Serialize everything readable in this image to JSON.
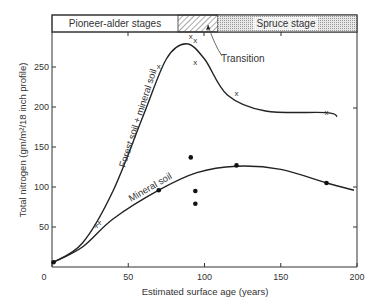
{
  "chart_data": {
    "type": "line",
    "title": "",
    "xlabel": "Estimated surface age (years)",
    "ylabel": "Total nitrogen (gm/m²/18 inch profile)",
    "xlim": [
      0,
      200
    ],
    "ylim": [
      0,
      290
    ],
    "x_ticks": [
      "0",
      "50",
      "100",
      "150",
      "200"
    ],
    "y_ticks": [
      "50",
      "100",
      "150",
      "200",
      "250"
    ],
    "grid": false,
    "stages": [
      {
        "label": "Pioneer-alder stages",
        "x_start": 0,
        "x_end": 84,
        "pattern": "none"
      },
      {
        "label": "",
        "x_start": 84,
        "x_end": 108,
        "pattern": "hatched"
      },
      {
        "label": "Spruce stage",
        "x_start": 108,
        "x_end": 200,
        "pattern": "stippled"
      }
    ],
    "annotations": [
      {
        "text": "Transition",
        "x": 106,
        "y": 228
      }
    ],
    "series": [
      {
        "name": "Forest soil + mineral soil",
        "marker": "x",
        "curve": [
          [
            1,
            6
          ],
          [
            20,
            30
          ],
          [
            40,
            95
          ],
          [
            60,
            190
          ],
          [
            75,
            260
          ],
          [
            88,
            279
          ],
          [
            100,
            260
          ],
          [
            115,
            215
          ],
          [
            140,
            195
          ],
          [
            180,
            193
          ],
          [
            187,
            188
          ]
        ],
        "points": [
          [
            29,
            52
          ],
          [
            31,
            56
          ],
          [
            70,
            251
          ],
          [
            91,
            289
          ],
          [
            94,
            284
          ],
          [
            94,
            256
          ],
          [
            121,
            218
          ],
          [
            180,
            194
          ]
        ]
      },
      {
        "name": "Mineral soil",
        "marker": "dot",
        "curve": [
          [
            1,
            6
          ],
          [
            20,
            25
          ],
          [
            40,
            60
          ],
          [
            70,
            96
          ],
          [
            95,
            118
          ],
          [
            121,
            126
          ],
          [
            150,
            122
          ],
          [
            180,
            105
          ],
          [
            198,
            96
          ]
        ],
        "points": [
          [
            1,
            6
          ],
          [
            70,
            96
          ],
          [
            91,
            137
          ],
          [
            94,
            95
          ],
          [
            94,
            79
          ],
          [
            121,
            127
          ],
          [
            180,
            105
          ]
        ]
      }
    ]
  },
  "labels": {
    "x_axis": "Estimated surface age (years)",
    "y_axis": "Total nitrogen (gm/m²/18 inch profile)",
    "stage_pioneer": "Pioneer-alder stages",
    "stage_spruce": "Spruce stage",
    "transition": "Transition",
    "curve_forest": "Forest soil + mineral soil",
    "curve_mineral": "Mineral soil"
  }
}
